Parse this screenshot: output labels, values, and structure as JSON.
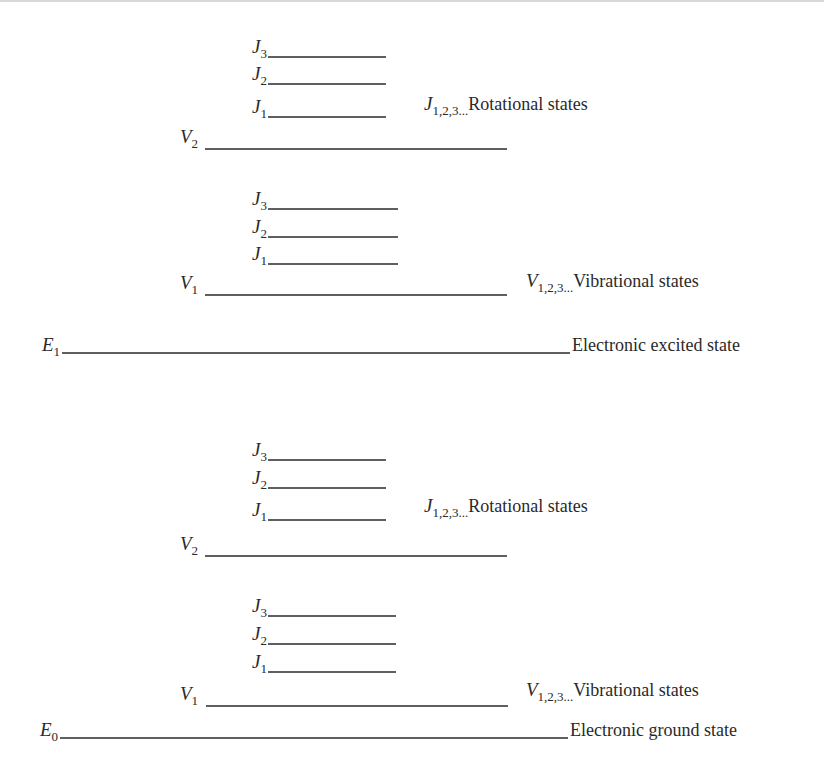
{
  "diagram": {
    "line_color": "#2a2a2a",
    "electronic_levels": [
      {
        "id": "E1",
        "symbol": "E",
        "sub": "1",
        "x1": 62,
        "x2": 570,
        "y": 353,
        "label": "Electronic excited state",
        "label_x": 572
      },
      {
        "id": "E0",
        "symbol": "E",
        "sub": "0",
        "x1": 60,
        "x2": 568,
        "y": 738,
        "label": "Electronic ground state",
        "label_x": 570
      }
    ],
    "vibrational_levels": [
      {
        "id": "upper-V2",
        "symbol": "V",
        "sub": "2",
        "x1": 205,
        "x2": 507,
        "y": 149,
        "label_x": 180
      },
      {
        "id": "upper-V1",
        "symbol": "V",
        "sub": "1",
        "x1": 205,
        "x2": 507,
        "y": 295,
        "label_x": 180
      },
      {
        "id": "lower-V2",
        "symbol": "V",
        "sub": "2",
        "x1": 205,
        "x2": 507,
        "y": 556,
        "label_x": 180
      },
      {
        "id": "lower-V1",
        "symbol": "V",
        "sub": "1",
        "x1": 206,
        "x2": 508,
        "y": 706,
        "label_x": 180
      }
    ],
    "rotational_levels": [
      {
        "id": "upper-V2-J3",
        "symbol": "J",
        "sub": "3",
        "x1": 268,
        "x2": 386,
        "y": 57
      },
      {
        "id": "upper-V2-J2",
        "symbol": "J",
        "sub": "2",
        "x1": 268,
        "x2": 386,
        "y": 84
      },
      {
        "id": "upper-V2-J1",
        "symbol": "J",
        "sub": "1",
        "x1": 268,
        "x2": 386,
        "y": 117
      },
      {
        "id": "upper-V1-J3",
        "symbol": "J",
        "sub": "3",
        "x1": 268,
        "x2": 398,
        "y": 209
      },
      {
        "id": "upper-V1-J2",
        "symbol": "J",
        "sub": "2",
        "x1": 268,
        "x2": 398,
        "y": 237
      },
      {
        "id": "upper-V1-J1",
        "symbol": "J",
        "sub": "1",
        "x1": 268,
        "x2": 398,
        "y": 264
      },
      {
        "id": "lower-V2-J3",
        "symbol": "J",
        "sub": "3",
        "x1": 268,
        "x2": 386,
        "y": 460
      },
      {
        "id": "lower-V2-J2",
        "symbol": "J",
        "sub": "2",
        "x1": 268,
        "x2": 386,
        "y": 488
      },
      {
        "id": "lower-V2-J1",
        "symbol": "J",
        "sub": "1",
        "x1": 268,
        "x2": 386,
        "y": 520
      },
      {
        "id": "lower-V1-J3",
        "symbol": "J",
        "sub": "3",
        "x1": 268,
        "x2": 396,
        "y": 616
      },
      {
        "id": "lower-V1-J2",
        "symbol": "J",
        "sub": "2",
        "x1": 268,
        "x2": 396,
        "y": 644
      },
      {
        "id": "lower-V1-J1",
        "symbol": "J",
        "sub": "1",
        "x1": 268,
        "x2": 396,
        "y": 672
      }
    ],
    "annotations": [
      {
        "id": "upper-rotational-note",
        "symbol": "J",
        "sub": "1,2,3...",
        "text": "Rotational states",
        "x": 424,
        "y": 110
      },
      {
        "id": "upper-vibrational-note",
        "symbol": "V",
        "sub": "1,2,3...",
        "text": "Vibrational states",
        "x": 526,
        "y": 287
      },
      {
        "id": "lower-rotational-note",
        "symbol": "J",
        "sub": "1,2,3...",
        "text": "Rotational states",
        "x": 424,
        "y": 512
      },
      {
        "id": "lower-vibrational-note",
        "symbol": "V",
        "sub": "1,2,3...",
        "text": "Vibrational states",
        "x": 526,
        "y": 696
      }
    ]
  }
}
